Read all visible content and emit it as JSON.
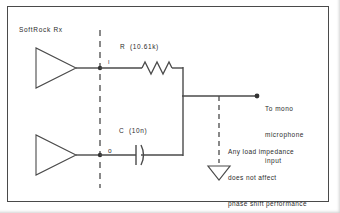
{
  "figure": {
    "title_label": "SoftRock Rx",
    "background_color": "#ffffff",
    "line_color": "#4a4a4a",
    "text_color": "#2b2b2b",
    "border_color": "#4a4a4a"
  },
  "components": {
    "resistor": {
      "label": "R  (10.61k)",
      "designator": "R",
      "value": "10.61k",
      "symbol": "resistor-zigzag"
    },
    "capacitor": {
      "label": "C  (10n)",
      "designator": "C",
      "value": "10n",
      "symbol": "capacitor-polarized"
    },
    "buffer_top": {
      "symbol": "amplifier-triangle"
    },
    "buffer_bottom": {
      "symbol": "amplifier-triangle"
    },
    "ground": {
      "symbol": "ground-triangle"
    }
  },
  "nodes": {
    "top_node_label": "I",
    "bottom_node_label": "o",
    "output_terminal_label": ""
  },
  "annotations": {
    "output": {
      "line1": "To mono",
      "line2": "microphone",
      "line3": "input"
    },
    "load_note": {
      "line1": "Any load impedance",
      "line2": "does not affect",
      "line3": "phase shift performance"
    }
  },
  "separators": {
    "boundary_line_style": "dashed",
    "ground_lead_style": "dashed"
  }
}
